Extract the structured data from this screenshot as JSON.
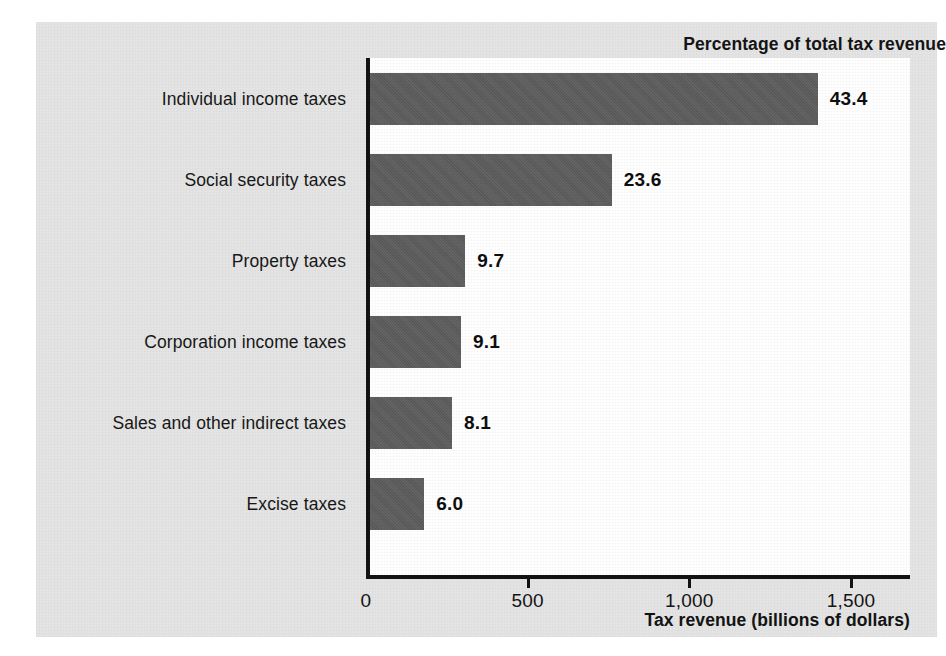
{
  "chart_data": {
    "type": "bar",
    "orientation": "horizontal",
    "title": "Percentage of total tax revenue",
    "xlabel": "Tax revenue (billions of dollars)",
    "ylabel": "",
    "xlim": [
      0,
      1500
    ],
    "xticks": [
      0,
      500,
      1000,
      1500
    ],
    "xtick_labels": [
      "0",
      "500",
      "1,000",
      "1,500"
    ],
    "grid": false,
    "legend": false,
    "categories": [
      "Individual income taxes",
      "Social security taxes",
      "Property taxes",
      "Corporation income taxes",
      "Sales and other indirect taxes",
      "Excise taxes"
    ],
    "values": [
      1397,
      760,
      307,
      294,
      266,
      180
    ],
    "data_labels": [
      "43.4",
      "23.6",
      "9.7",
      "9.1",
      "8.1",
      "6.0"
    ],
    "data_label_units": "percent",
    "series": [
      {
        "name": "Tax revenue (billions of dollars)",
        "values": [
          1397,
          760,
          307,
          294,
          266,
          180
        ]
      }
    ],
    "points": [
      {
        "category": "Individual income taxes",
        "value": 1397,
        "percent": "43.4"
      },
      {
        "category": "Social security taxes",
        "value": 760,
        "percent": "23.6"
      },
      {
        "category": "Property taxes",
        "value": 307,
        "percent": "9.7"
      },
      {
        "category": "Corporation income taxes",
        "value": 294,
        "percent": "9.1"
      },
      {
        "category": "Sales and other indirect taxes",
        "value": 266,
        "percent": "8.1"
      },
      {
        "category": "Excise taxes",
        "value": 180,
        "percent": "6.0"
      }
    ],
    "colors": {
      "bar": "#5d5d5d",
      "panel_background": "#e4e4e4",
      "plot_background": "#ffffff",
      "axis": "#121212",
      "text": "#141414"
    }
  },
  "source_note": ""
}
